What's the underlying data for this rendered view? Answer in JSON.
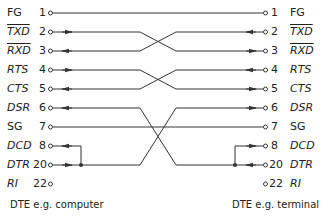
{
  "diagram": {
    "left_device": "DTE e.g. computer",
    "right_device": "DTE e.g. terminal",
    "signals": [
      {
        "name": "FG",
        "pin": "1",
        "italic": false,
        "overline": false
      },
      {
        "name": "TXD",
        "pin": "2",
        "italic": true,
        "overline": true
      },
      {
        "name": "RXD",
        "pin": "3",
        "italic": true,
        "overline": true
      },
      {
        "name": "RTS",
        "pin": "4",
        "italic": true,
        "overline": false
      },
      {
        "name": "CTS",
        "pin": "5",
        "italic": true,
        "overline": false
      },
      {
        "name": "DSR",
        "pin": "6",
        "italic": true,
        "overline": false
      },
      {
        "name": "SG",
        "pin": "7",
        "italic": false,
        "overline": false
      },
      {
        "name": "DCD",
        "pin": "8",
        "italic": true,
        "overline": false
      },
      {
        "name": "DTR",
        "pin": "20",
        "italic": true,
        "overline": false
      },
      {
        "name": "RI",
        "pin": "22",
        "italic": true,
        "overline": false
      }
    ],
    "connections": [
      {
        "from": "FG 1",
        "to": "FG 1",
        "type": "straight"
      },
      {
        "from": "TXD 2",
        "to": "RXD 3",
        "type": "crossed"
      },
      {
        "from": "RXD 3",
        "to": "TXD 2",
        "type": "crossed"
      },
      {
        "from": "RTS 4",
        "to": "CTS 5",
        "type": "crossed"
      },
      {
        "from": "CTS 5",
        "to": "RTS 4",
        "type": "crossed"
      },
      {
        "from": "DTR 20 + DCD 8",
        "to": "DSR 6",
        "type": "crossed"
      },
      {
        "from": "DSR 6",
        "to": "DTR 20 + DCD 8",
        "type": "crossed"
      },
      {
        "from": "SG 7",
        "to": "SG 7",
        "type": "straight"
      },
      {
        "from": "RI 22",
        "to": "RI 22",
        "type": "unconnected"
      }
    ],
    "colors": {
      "line": "#333333",
      "text": "#222222"
    }
  }
}
